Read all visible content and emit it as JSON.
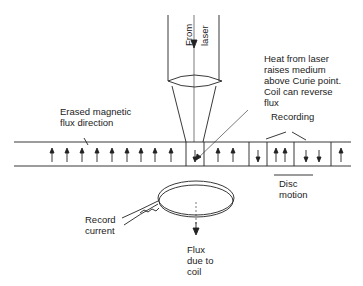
{
  "labels": {
    "from": "From",
    "laser": "laser",
    "heat_note": "Heat from laser\nraises medium\nabove Curie point.\nCoil can reverse\nflux",
    "erased": "Erased magnetic\nflux direction",
    "recording": "Recording",
    "disc_motion": "Disc\nmotion",
    "record_current": "Record\ncurrent",
    "flux_coil": "Flux\ndue to\ncoil"
  },
  "stripe": {
    "up_arrows_erased": 9,
    "cells": [
      "down",
      "up up",
      "down",
      "up up",
      "down down",
      "up"
    ]
  }
}
